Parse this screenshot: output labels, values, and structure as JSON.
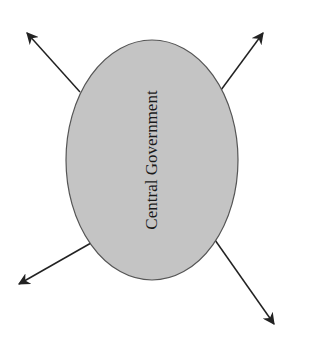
{
  "diagram": {
    "center_node": {
      "label": "Central Government",
      "fill": "#c4c4c4",
      "stroke": "#555555",
      "cx": 152,
      "cy": 160,
      "rx": 86,
      "ry": 120
    },
    "arrows": [
      {
        "name": "arrow-up-left",
        "from": [
          80,
          92
        ],
        "to": [
          27,
          33
        ]
      },
      {
        "name": "arrow-up-right",
        "from": [
          221,
          90
        ],
        "to": [
          263,
          33
        ]
      },
      {
        "name": "arrow-down-left",
        "from": [
          91,
          243
        ],
        "to": [
          19,
          284
        ]
      },
      {
        "name": "arrow-down-right",
        "from": [
          215,
          240
        ],
        "to": [
          274,
          324
        ]
      }
    ],
    "arrow_color": "#222222"
  }
}
